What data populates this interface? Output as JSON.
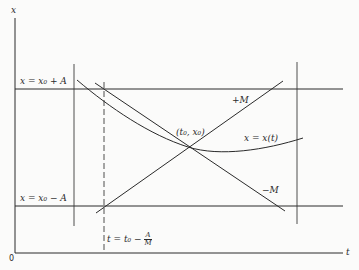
{
  "diagram": {
    "axes": {
      "vertical_label": "x",
      "horizontal_label": "t",
      "origin_label": "0"
    },
    "horizontal_lines": {
      "upper_label": "x = x₀ + A",
      "lower_label": "x = x₀ − A"
    },
    "slope_lines": {
      "positive_label": "+M",
      "negative_label": "−M"
    },
    "point_label": "(t₀, x₀)",
    "curve_label": "x = x(t)",
    "dashed_line_label": {
      "prefix": "t = t₀ −",
      "numerator": "A",
      "denominator": "M"
    },
    "colors": {
      "line": "#2a2a2a",
      "background": "#fbfbfa"
    }
  }
}
